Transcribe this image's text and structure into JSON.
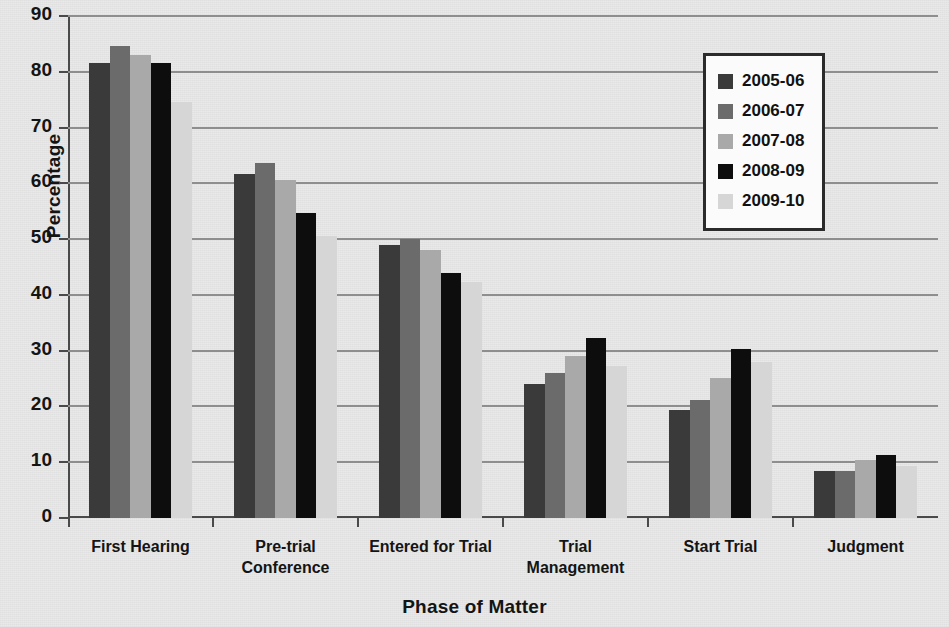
{
  "chart_data": {
    "type": "bar",
    "title": "",
    "xlabel": "Phase of Matter",
    "ylabel": "Percentage",
    "ylim": [
      0,
      90
    ],
    "ytick_step": 10,
    "yticks": [
      90,
      80,
      70,
      60,
      50,
      40,
      30,
      20,
      10,
      0
    ],
    "grid": true,
    "legend_position": "top-right",
    "categories": [
      "First Hearing",
      "Pre-trial\nConference",
      "Entered for Trial",
      "Trial\nManagement",
      "Start Trial",
      "Judgment"
    ],
    "category_lines": [
      [
        "First Hearing"
      ],
      [
        "Pre-trial",
        "Conference"
      ],
      [
        "Entered for Trial"
      ],
      [
        "Trial",
        "Management"
      ],
      [
        "Start Trial"
      ],
      [
        "Judgment"
      ]
    ],
    "series": [
      {
        "name": "2005-06",
        "color": "#3a3a3a",
        "values": [
          82.0,
          62.0,
          49.3,
          24.3,
          19.7,
          8.7
        ]
      },
      {
        "name": "2006-07",
        "color": "#6b6b6b",
        "values": [
          85.0,
          64.0,
          50.3,
          26.4,
          21.5,
          8.8
        ]
      },
      {
        "name": "2007-08",
        "color": "#a9a9a9",
        "values": [
          83.4,
          61.0,
          48.4,
          29.4,
          25.5,
          10.7
        ]
      },
      {
        "name": "2008-09",
        "color": "#0d0d0d",
        "values": [
          82.0,
          55.0,
          44.3,
          32.7,
          30.7,
          11.6
        ]
      },
      {
        "name": "2009-10",
        "color": "#d6d6d6",
        "values": [
          75.0,
          51.0,
          42.6,
          27.6,
          28.4,
          9.7
        ]
      }
    ]
  },
  "legend": {
    "entries": [
      {
        "label": "2005-06",
        "color": "#3a3a3a"
      },
      {
        "label": "2006-07",
        "color": "#6b6b6b"
      },
      {
        "label": "2007-08",
        "color": "#a9a9a9"
      },
      {
        "label": "2008-09",
        "color": "#0d0d0d"
      },
      {
        "label": "2009-10",
        "color": "#d6d6d6"
      }
    ]
  },
  "axes": {
    "y_title": "Percentage",
    "x_title": "Phase of Matter"
  }
}
